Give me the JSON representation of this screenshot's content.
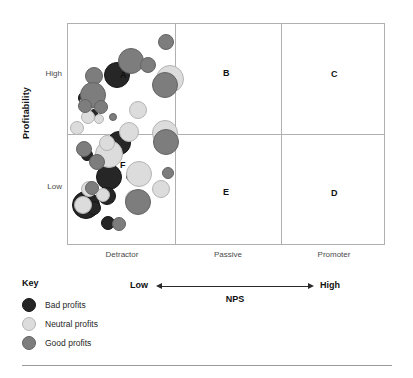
{
  "axes": {
    "y_title": "Profitability",
    "y_ticks": [
      "High",
      "Low"
    ],
    "x_ticks": [
      "Detractor",
      "Passive",
      "Promoter"
    ]
  },
  "nps_axis": {
    "low_label": "Low",
    "high_label": "High",
    "title": "NPS"
  },
  "legend": {
    "title": "Key",
    "items": [
      {
        "label": "Bad profits",
        "color": "#262626"
      },
      {
        "label": "Neutral profits",
        "color": "#dcdcdc"
      },
      {
        "label": "Good profits",
        "color": "#7d7d7d"
      }
    ]
  },
  "quadrant_letters": [
    {
      "label": "A",
      "x": 52,
      "y": 47
    },
    {
      "label": "B",
      "x": 155,
      "y": 45
    },
    {
      "label": "C",
      "x": 263,
      "y": 46
    },
    {
      "label": "D",
      "x": 263,
      "y": 165
    },
    {
      "label": "E",
      "x": 155,
      "y": 164
    },
    {
      "label": "F",
      "x": 52,
      "y": 137
    }
  ],
  "chart_data": {
    "type": "scatter",
    "xlabel": "NPS",
    "ylabel": "Profitability",
    "x_categories": [
      "Detractor",
      "Passive",
      "Promoter"
    ],
    "y_categories": [
      "Low",
      "High"
    ],
    "grid": false,
    "legend_position": "below-left",
    "series": [
      {
        "name": "Bad profits",
        "color": "#262626",
        "points": [
          {
            "x": 36,
            "y": 38,
            "r": 13
          },
          {
            "x": 10,
            "y": 67,
            "r": 7
          },
          {
            "x": 20,
            "y": 85,
            "r": 5
          },
          {
            "x": 39,
            "y": 107,
            "r": 12
          },
          {
            "x": 13,
            "y": 125,
            "r": 6
          },
          {
            "x": 28,
            "y": 140,
            "r": 13
          },
          {
            "x": 58,
            "y": 145,
            "r": 7
          },
          {
            "x": 4,
            "y": 167,
            "r": 14
          },
          {
            "x": 19,
            "y": 177,
            "r": 7
          },
          {
            "x": 30,
            "y": 163,
            "r": 9
          },
          {
            "x": 33,
            "y": 192,
            "r": 7
          }
        ]
      },
      {
        "name": "Neutral profits",
        "color": "#dcdcdc",
        "points": [
          {
            "x": 88,
            "y": 41,
            "r": 14
          },
          {
            "x": 11,
            "y": 72,
            "r": 8
          },
          {
            "x": 29,
            "y": 78,
            "r": 5
          },
          {
            "x": 13,
            "y": 86,
            "r": 7
          },
          {
            "x": 26,
            "y": 90,
            "r": 5
          },
          {
            "x": 61,
            "y": 77,
            "r": 9
          },
          {
            "x": 2,
            "y": 97,
            "r": 7
          },
          {
            "x": 51,
            "y": 98,
            "r": 10
          },
          {
            "x": 84,
            "y": 96,
            "r": 13
          },
          {
            "x": 86,
            "y": 114,
            "r": 7
          },
          {
            "x": 27,
            "y": 116,
            "r": 14
          },
          {
            "x": 31,
            "y": 111,
            "r": 8
          },
          {
            "x": 58,
            "y": 137,
            "r": 13
          },
          {
            "x": 13,
            "y": 157,
            "r": 8
          },
          {
            "x": 28,
            "y": 164,
            "r": 7
          },
          {
            "x": 84,
            "y": 156,
            "r": 9
          },
          {
            "x": 57,
            "y": 166,
            "r": 9
          },
          {
            "x": 6,
            "y": 172,
            "r": 9
          }
        ]
      },
      {
        "name": "Good profits",
        "color": "#7d7d7d",
        "points": [
          {
            "x": 90,
            "y": 10,
            "r": 8
          },
          {
            "x": 50,
            "y": 24,
            "r": 13
          },
          {
            "x": 72,
            "y": 33,
            "r": 8
          },
          {
            "x": 17,
            "y": 43,
            "r": 9
          },
          {
            "x": 84,
            "y": 48,
            "r": 13
          },
          {
            "x": 12,
            "y": 58,
            "r": 13
          },
          {
            "x": 10,
            "y": 75,
            "r": 7
          },
          {
            "x": 26,
            "y": 76,
            "r": 7
          },
          {
            "x": 41,
            "y": 89,
            "r": 4
          },
          {
            "x": 85,
            "y": 105,
            "r": 13
          },
          {
            "x": 8,
            "y": 117,
            "r": 8
          },
          {
            "x": 21,
            "y": 130,
            "r": 8
          },
          {
            "x": 94,
            "y": 143,
            "r": 6
          },
          {
            "x": 17,
            "y": 157,
            "r": 7
          },
          {
            "x": 57,
            "y": 165,
            "r": 13
          },
          {
            "x": 44,
            "y": 193,
            "r": 7
          }
        ]
      }
    ]
  }
}
